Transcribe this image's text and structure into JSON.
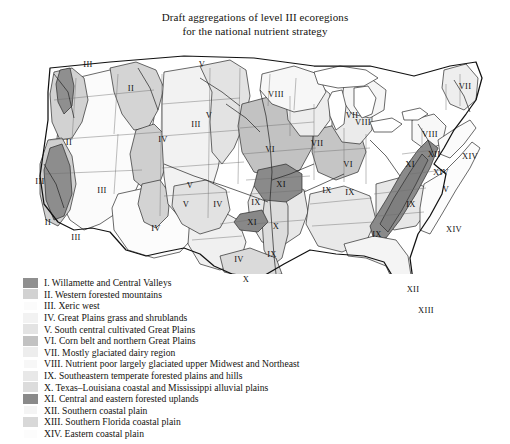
{
  "figure": {
    "title_line1": "Draft aggregations of level III ecoregions",
    "title_line2": "for the national nutrient strategy",
    "background": "#ffffff"
  },
  "map": {
    "name": "united-states-ecoregions-map",
    "projection_note": "contiguous United States with state and ecoregion boundaries",
    "labels": [
      {
        "text": "III",
        "x": 74,
        "y": 20
      },
      {
        "text": "II",
        "x": 117,
        "y": 44
      },
      {
        "text": "V",
        "x": 188,
        "y": 20
      },
      {
        "text": "II",
        "x": 55,
        "y": 98
      },
      {
        "text": "III",
        "x": 182,
        "y": 80
      },
      {
        "text": "III",
        "x": 26,
        "y": 137
      },
      {
        "text": "II",
        "x": 34,
        "y": 178
      },
      {
        "text": "III",
        "x": 88,
        "y": 146
      },
      {
        "text": "IV",
        "x": 149,
        "y": 95
      },
      {
        "text": "V",
        "x": 195,
        "y": 71
      },
      {
        "text": "VIII",
        "x": 262,
        "y": 50
      },
      {
        "text": "VII",
        "x": 303,
        "y": 99
      },
      {
        "text": "VIII",
        "x": 349,
        "y": 78
      },
      {
        "text": "VII",
        "x": 338,
        "y": 71
      },
      {
        "text": "VI",
        "x": 256,
        "y": 105
      },
      {
        "text": "III",
        "x": 62,
        "y": 193
      },
      {
        "text": "IV",
        "x": 142,
        "y": 184
      },
      {
        "text": "V",
        "x": 172,
        "y": 160
      },
      {
        "text": "IV",
        "x": 204,
        "y": 160
      },
      {
        "text": "V",
        "x": 176,
        "y": 141
      },
      {
        "text": "IX",
        "x": 242,
        "y": 158
      },
      {
        "text": "XI",
        "x": 267,
        "y": 140
      },
      {
        "text": "XI",
        "x": 238,
        "y": 178
      },
      {
        "text": "X",
        "x": 262,
        "y": 182
      },
      {
        "text": "IX",
        "x": 258,
        "y": 210
      },
      {
        "text": "IV",
        "x": 225,
        "y": 215
      },
      {
        "text": "X",
        "x": 232,
        "y": 235
      },
      {
        "text": "IX",
        "x": 336,
        "y": 148
      },
      {
        "text": "IX",
        "x": 363,
        "y": 190
      },
      {
        "text": "XI",
        "x": 396,
        "y": 120
      },
      {
        "text": "VI",
        "x": 334,
        "y": 120
      },
      {
        "text": "IX",
        "x": 313,
        "y": 146
      },
      {
        "text": "IX",
        "x": 397,
        "y": 160
      },
      {
        "text": "V",
        "x": 432,
        "y": 145
      },
      {
        "text": "XIV",
        "x": 440,
        "y": 185
      },
      {
        "text": "XIV",
        "x": 456,
        "y": 112
      },
      {
        "text": "VII",
        "x": 451,
        "y": 42
      },
      {
        "text": "VIII",
        "x": 416,
        "y": 90
      },
      {
        "text": "XII",
        "x": 420,
        "y": 110
      },
      {
        "text": "XIV",
        "x": 427,
        "y": 128
      },
      {
        "text": "XII",
        "x": 399,
        "y": 245
      },
      {
        "text": "XIII",
        "x": 412,
        "y": 266
      }
    ]
  },
  "legend": {
    "name": "ecoregion-legend",
    "items": [
      {
        "numeral": "I",
        "label": "I. Willamette and Central Valleys",
        "color": "#8f8f8f"
      },
      {
        "numeral": "II",
        "label": "II. Western forested mountains",
        "color": "#d2d2d2"
      },
      {
        "numeral": "III",
        "label": "III. Xeric west",
        "color": "#fbfbfb"
      },
      {
        "numeral": "IV",
        "label": "IV. Great Plains grass and shrublands",
        "color": "#f2f2f2"
      },
      {
        "numeral": "V",
        "label": "V. South central cultivated Great Plains",
        "color": "#e3e3e3"
      },
      {
        "numeral": "VI",
        "label": "VI. Corn belt and northern Great Plains",
        "color": "#c2c2c2"
      },
      {
        "numeral": "VII",
        "label": "VII. Mostly glaciated dairy region",
        "color": "#ededed"
      },
      {
        "numeral": "VIII",
        "label": "VIII. Nutrient poor largely glaciated upper Midwest and Northeast",
        "color": "#f7f7f7"
      },
      {
        "numeral": "IX",
        "label": "IX. Southeastern temperate forested plains and hills",
        "color": "#e8e8e8"
      },
      {
        "numeral": "X",
        "label": "X. Texas–Louisiana coastal and Mississippi alluvial plains",
        "color": "#dcdcdc"
      },
      {
        "numeral": "XI",
        "label": "XI. Central and eastern forested uplands",
        "color": "#8a8a8a"
      },
      {
        "numeral": "XII",
        "label": "XII. Southern coastal plain",
        "color": "#f4f4f4"
      },
      {
        "numeral": "XIII",
        "label": "XIII. Southern Florida coastal plain",
        "color": "#d8d8d8"
      },
      {
        "numeral": "XIV",
        "label": "XIV. Eastern coastal plain",
        "color": "#fcfcfc"
      }
    ]
  }
}
